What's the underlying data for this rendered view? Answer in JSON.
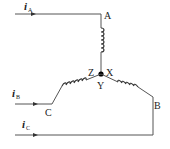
{
  "diagram": {
    "type": "three-phase star (Y) connected windings",
    "currents": [
      {
        "symbol": "i",
        "subscript": "A"
      },
      {
        "symbol": "i",
        "subscript": "B"
      },
      {
        "symbol": "i",
        "subscript": "C"
      }
    ],
    "terminals": {
      "A": "A",
      "B": "B",
      "C": "C"
    },
    "neutral_labels": {
      "X": "X",
      "Y": "Y",
      "Z": "Z"
    },
    "colors": {
      "line": "#555555",
      "coil": "#333333",
      "node": "#000000",
      "text": "#222222"
    }
  }
}
